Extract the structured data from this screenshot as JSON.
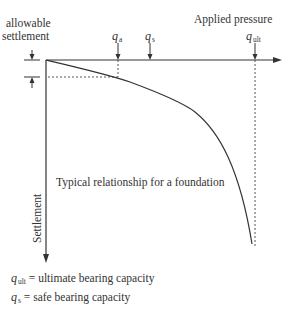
{
  "diagram": {
    "x_axis_label": "Applied pressure",
    "y_axis_label": "Settlement",
    "allowable_settlement_label_line1": "allowable",
    "allowable_settlement_label_line2": "settlement",
    "markers": [
      {
        "symbol": "q",
        "subscript": "a"
      },
      {
        "symbol": "q",
        "subscript": "s"
      },
      {
        "symbol": "q",
        "subscript": "ult"
      }
    ],
    "curve_annotation": "Typical relationship for a foundation",
    "legend": [
      {
        "symbol": "q",
        "subscript": "ult",
        "text": "= ultimate bearing capacity"
      },
      {
        "symbol": "q",
        "subscript": "s",
        "text": "= safe bearing capacity"
      }
    ],
    "colors": {
      "line": "#333333",
      "dotted": "#555555",
      "background": "#ffffff"
    }
  }
}
